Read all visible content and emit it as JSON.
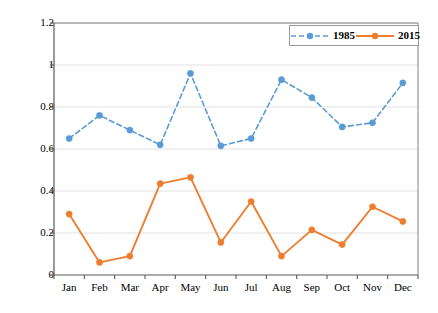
{
  "chart_data": {
    "type": "line",
    "title": "",
    "xlabel": "",
    "ylabel": "CDI value",
    "categories": [
      "Jan",
      "Feb",
      "Mar",
      "Apr",
      "May",
      "Jun",
      "Jul",
      "Aug",
      "Sep",
      "Oct",
      "Nov",
      "Dec"
    ],
    "ylim": [
      0,
      1.2
    ],
    "yticks": [
      "0",
      "0.2",
      "0.4",
      "0.6",
      "0.8",
      "1",
      "1.2"
    ],
    "ytick_values": [
      0,
      0.2,
      0.4,
      0.6,
      0.8,
      1,
      1.2
    ],
    "grid": "horizontal",
    "legend_position": "top-right",
    "series": [
      {
        "name": "1985",
        "color": "#5B9BD5",
        "style": "dashed",
        "marker": "circle",
        "values": [
          0.65,
          0.76,
          0.69,
          0.62,
          0.96,
          0.615,
          0.65,
          0.93,
          0.845,
          0.705,
          0.725,
          0.915
        ]
      },
      {
        "name": "2015",
        "color": "#ED7D31",
        "style": "solid",
        "marker": "circle",
        "values": [
          0.29,
          0.06,
          0.09,
          0.435,
          0.465,
          0.155,
          0.35,
          0.09,
          0.215,
          0.145,
          0.325,
          0.255
        ]
      }
    ]
  },
  "legend": {
    "entries": [
      {
        "label": "1985"
      },
      {
        "label": "2015"
      }
    ]
  },
  "colors": {
    "series_1985": "#5B9BD5",
    "series_2015": "#ED7D31",
    "grid": "#d9d9d9",
    "axis": "#7f7f7f",
    "text": "#000000"
  }
}
